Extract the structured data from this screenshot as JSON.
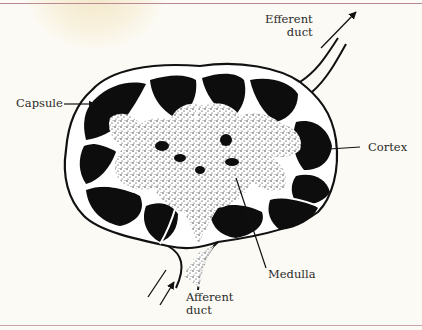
{
  "figure": {
    "labels": {
      "efferent_duct": {
        "line1": "Efferent",
        "line2": "duct"
      },
      "capsule": "Capsule",
      "cortex": "Cortex",
      "medulla": "Medulla",
      "afferent_duct": {
        "line1": "Afferent",
        "line2": "duct"
      }
    },
    "colors": {
      "background": "#fcfaf4",
      "ink": "#111111",
      "border_rule": "#b88a96",
      "stain": "#ecd6a0"
    }
  }
}
